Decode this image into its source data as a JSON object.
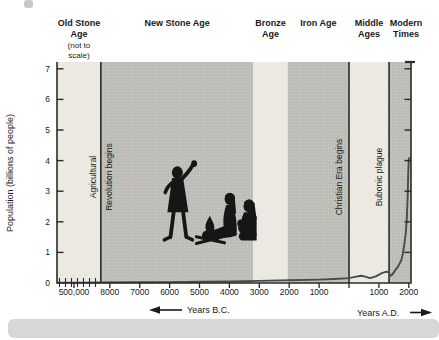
{
  "chart_data": {
    "type": "line",
    "title": "",
    "ylabel": "Population (billions of people)",
    "ylim": [
      0,
      7
    ],
    "y_ticks": [
      0,
      1,
      2,
      3,
      4,
      5,
      6,
      7
    ],
    "x_axis": {
      "bc_caption": "Years B.C.",
      "ad_caption": "Years A.D.",
      "note": "left portion before 8000 B.C. is not to scale"
    },
    "x_ticks": [
      {
        "label": "500,000",
        "year": -500000
      },
      {
        "label": "8000",
        "year": -8000
      },
      {
        "label": "7000",
        "year": -7000
      },
      {
        "label": "6000",
        "year": -6000
      },
      {
        "label": "5000",
        "year": -5000
      },
      {
        "label": "4000",
        "year": -4000
      },
      {
        "label": "3000",
        "year": -3000
      },
      {
        "label": "2000",
        "year": -2000
      },
      {
        "label": "1000",
        "year": -1000
      },
      {
        "label": "",
        "year": 0
      },
      {
        "label": "1000",
        "year": 1000
      },
      {
        "label": "2000",
        "year": 2000
      }
    ],
    "eras": [
      {
        "id": "old-stone-age",
        "label_lines": [
          "Old Stone",
          "Age"
        ],
        "sublabel_lines": [
          "(not to",
          "scale)"
        ],
        "start_year": null,
        "end_year": -8300,
        "shade": "light"
      },
      {
        "id": "new-stone-age",
        "label_lines": [
          "New Stone Age"
        ],
        "sublabel_lines": [],
        "start_year": -8300,
        "end_year": -3200,
        "shade": "dark"
      },
      {
        "id": "bronze-age",
        "label_lines": [
          "Bronze",
          "Age"
        ],
        "sublabel_lines": [],
        "start_year": -3200,
        "end_year": -2050,
        "shade": "light"
      },
      {
        "id": "iron-age",
        "label_lines": [
          "Iron Age"
        ],
        "sublabel_lines": [],
        "start_year": -2050,
        "end_year": 0,
        "shade": "dark"
      },
      {
        "id": "middle-ages",
        "label_lines": [
          "Middle",
          "Ages"
        ],
        "sublabel_lines": [],
        "start_year": 0,
        "end_year": 1340,
        "shade": "light"
      },
      {
        "id": "modern-times",
        "label_lines": [
          "Modern",
          "Times"
        ],
        "sublabel_lines": [],
        "start_year": 1340,
        "end_year": null,
        "shade": "dark"
      }
    ],
    "events": [
      {
        "id": "agricultural-revolution",
        "label_lines": [
          "Agricultural",
          "Revolution begins"
        ],
        "year": -8300
      },
      {
        "id": "christian-era",
        "label_lines": [
          "Christian Era begins"
        ],
        "year": 0
      },
      {
        "id": "bubonic-plague",
        "label_lines": [
          "Bubonic plague"
        ],
        "year": 1340
      }
    ],
    "series": [
      {
        "name": "world-population",
        "points": [
          [
            -500000,
            0.012
          ],
          [
            -200000,
            0.012
          ],
          [
            -50000,
            0.015
          ],
          [
            -8300,
            0.02
          ],
          [
            -7000,
            0.025
          ],
          [
            -6000,
            0.03
          ],
          [
            -5000,
            0.04
          ],
          [
            -4000,
            0.05
          ],
          [
            -3000,
            0.07
          ],
          [
            -2000,
            0.09
          ],
          [
            -1000,
            0.11
          ],
          [
            -500,
            0.13
          ],
          [
            0,
            0.16
          ],
          [
            200,
            0.2
          ],
          [
            400,
            0.24
          ],
          [
            550,
            0.21
          ],
          [
            700,
            0.16
          ],
          [
            900,
            0.22
          ],
          [
            1100,
            0.32
          ],
          [
            1250,
            0.37
          ],
          [
            1340,
            0.35
          ],
          [
            1370,
            0.22
          ],
          [
            1450,
            0.28
          ],
          [
            1550,
            0.42
          ],
          [
            1650,
            0.55
          ],
          [
            1750,
            0.75
          ],
          [
            1800,
            0.95
          ],
          [
            1850,
            1.25
          ],
          [
            1900,
            1.65
          ],
          [
            1930,
            2.05
          ],
          [
            1950,
            2.5
          ],
          [
            1965,
            3.0
          ],
          [
            1980,
            3.55
          ],
          [
            2000,
            4.05
          ],
          [
            2040,
            4.1
          ]
        ]
      }
    ],
    "illustration": {
      "id": "cave-people-illustration",
      "description": "Stone Age family around a campfire"
    },
    "colors": {
      "background": "#ffffff",
      "band_light": "#ece9e2",
      "band_dark": "#bdbcb6",
      "band_dot": "#cfcec8",
      "line": "#2a2a28",
      "curve": "#4a4a46",
      "text": "#1a1a1a",
      "page_edge": "#d7d7d7",
      "illustration": "#161616"
    }
  }
}
